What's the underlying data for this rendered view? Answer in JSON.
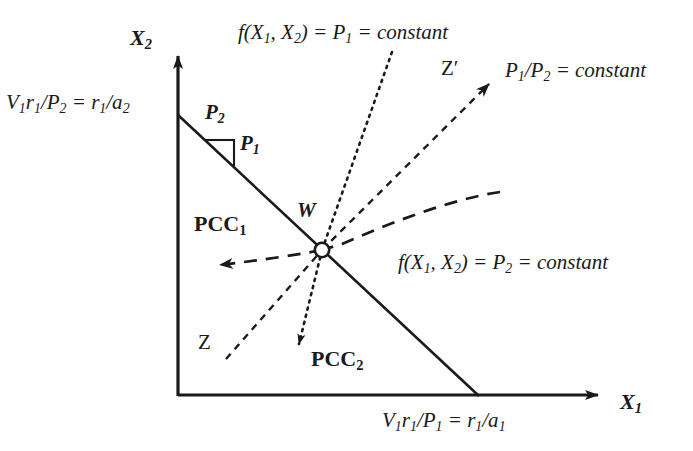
{
  "figure": {
    "background_color": "#ffffff",
    "ink_color": "#1a1a1a",
    "width": 693,
    "height": 451
  },
  "axes": {
    "y_label": "X2",
    "y_label_parts": {
      "base": "X",
      "sub": "2"
    },
    "x_label": "X1",
    "x_label_parts": {
      "base": "X",
      "sub": "1"
    },
    "origin_px": [
      178,
      395
    ],
    "x_axis_end_px": [
      612,
      395
    ],
    "y_axis_end_px": [
      178,
      44
    ]
  },
  "labels": {
    "y_intercept": {
      "id": "y-intercept-label",
      "text": "V1r1/P2 = r1/a2",
      "parts": [
        {
          "base": "V",
          "sub": "1",
          "italic": true
        },
        {
          "base": "r",
          "sub": "1",
          "italic": true
        },
        {
          "base": "/P",
          "sub": "2",
          "italic": true
        },
        {
          "base": " = r",
          "sub": "1",
          "italic": true
        },
        {
          "base": "/a",
          "sub": "2",
          "italic": true
        }
      ]
    },
    "x_intercept": {
      "id": "x-intercept-label",
      "text": "V1r1/P1 = r1/a1",
      "parts": [
        {
          "base": "V",
          "sub": "1",
          "italic": true
        },
        {
          "base": "r",
          "sub": "1",
          "italic": true
        },
        {
          "base": "/P",
          "sub": "1",
          "italic": true
        },
        {
          "base": " = r",
          "sub": "1",
          "italic": true
        },
        {
          "base": "/a",
          "sub": "1",
          "italic": true
        }
      ]
    },
    "slope_rise": {
      "id": "slope-rise-label",
      "base": "P",
      "sub": "2"
    },
    "slope_run": {
      "id": "slope-run-label",
      "base": "P",
      "sub": "1"
    },
    "point_w": {
      "id": "point-w-label",
      "text": "W"
    },
    "pcc1": {
      "id": "pcc1-label",
      "base": "PCC",
      "sub": "1"
    },
    "pcc2": {
      "id": "pcc2-label",
      "base": "PCC",
      "sub": "2"
    },
    "z": {
      "id": "z-label",
      "text": "Z"
    },
    "z_prime": {
      "id": "z-prime-label",
      "text": "Z′"
    },
    "iso_p1": {
      "id": "isoquant-p1-label",
      "text": "f(X1, X2) = P1 = constant",
      "parts": [
        {
          "base": "f(X",
          "sub": "1",
          "italic": true
        },
        {
          "base": ", X",
          "sub": "2",
          "italic": true
        },
        {
          "base": ") = P",
          "sub": "1",
          "italic": true
        },
        {
          "base": " = constant",
          "sub": "",
          "italic": true
        }
      ]
    },
    "iso_p2": {
      "id": "isoquant-p2-label",
      "text": "f(X1, X2) = P2 = constant",
      "parts": [
        {
          "base": "f(X",
          "sub": "1",
          "italic": true
        },
        {
          "base": ", X",
          "sub": "2",
          "italic": true
        },
        {
          "base": ") = P",
          "sub": "2",
          "italic": true
        },
        {
          "base": " = constant",
          "sub": "",
          "italic": true
        }
      ]
    },
    "price_ratio": {
      "id": "price-ratio-label",
      "text": "P1/P2 = constant",
      "parts": [
        {
          "base": "P",
          "sub": "1",
          "italic": true
        },
        {
          "base": "/P",
          "sub": "2",
          "italic": true
        },
        {
          "base": " = constant",
          "sub": "",
          "italic": true
        }
      ]
    }
  },
  "curves": {
    "budget_line": {
      "name": "budget-line",
      "style": "solid",
      "from_px": [
        178,
        115
      ],
      "to_px": [
        478,
        395
      ]
    },
    "slope_triangle": {
      "name": "slope-triangle",
      "style": "solid",
      "horizontal_px": [
        [
          205,
          140
        ],
        [
          234,
          140
        ]
      ],
      "vertical_px": [
        [
          234,
          140
        ],
        [
          234,
          165
        ]
      ]
    },
    "pcc1_curve": {
      "name": "pcc1-curve",
      "style": "dashed",
      "description": "long-dashed curve through W, arrow pointing left",
      "arrow_tip_px": [
        203,
        265
      ]
    },
    "pcc2_curve": {
      "name": "pcc2-curve",
      "style": "dotted",
      "description": "dotted line through W, arrow pointing down-right-of-origin",
      "arrow_tip_px": [
        301,
        358
      ]
    },
    "z_ray": {
      "name": "z-ray",
      "style": "dashed",
      "from_px": [
        224,
        360
      ],
      "to_px": [
        322,
        250
      ]
    },
    "z_prime_ray": {
      "name": "z-prime-ray",
      "style": "dashed",
      "from_px": [
        322,
        250
      ],
      "to_px": [
        498,
        74
      ],
      "arrow_tip_px": [
        498,
        74
      ]
    },
    "point_w_marker": {
      "name": "point-w-marker",
      "style": "open-circle",
      "center_px": [
        322,
        250
      ],
      "radius_px": 7
    }
  }
}
